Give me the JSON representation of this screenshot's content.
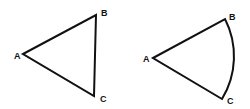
{
  "figures": [
    {
      "name": "triangle",
      "labels": {
        "a": "A",
        "b": "B",
        "c": "C"
      }
    },
    {
      "name": "sector",
      "labels": {
        "a": "A",
        "b": "B",
        "c": "C"
      }
    }
  ],
  "colors": {
    "stroke": "#111111",
    "background": "#ffffff"
  }
}
